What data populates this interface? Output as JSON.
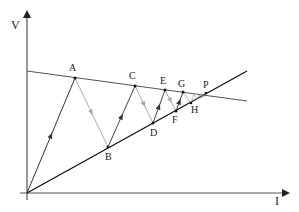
{
  "diagram": {
    "axes": {
      "y_label": "V",
      "x_label": "I",
      "origin": [
        27,
        193
      ],
      "y_axis_tip": [
        27,
        10
      ],
      "x_axis_tip": [
        290,
        193
      ]
    },
    "lines": {
      "load_line": {
        "from": [
          27,
          71
        ],
        "to": [
          247,
          101
        ],
        "color": "#555555"
      },
      "rising_line": {
        "from": [
          27,
          193
        ],
        "to": [
          247,
          71
        ],
        "color": "#111111"
      }
    },
    "points": [
      {
        "name": "A",
        "x": 75,
        "y": 78,
        "label_dx": -4,
        "label_dy": -6
      },
      {
        "name": "B",
        "x": 108,
        "y": 147,
        "label_dx": 0,
        "label_dy": 14
      },
      {
        "name": "C",
        "x": 135,
        "y": 86,
        "label_dx": -4,
        "label_dy": -6
      },
      {
        "name": "D",
        "x": 153,
        "y": 123,
        "label_dx": 0,
        "label_dy": 14
      },
      {
        "name": "E",
        "x": 165,
        "y": 90,
        "label_dx": -4,
        "label_dy": -6
      },
      {
        "name": "F",
        "x": 176,
        "y": 111,
        "label_dx": 0,
        "label_dy": 12
      },
      {
        "name": "G",
        "x": 183,
        "y": 92,
        "label_dx": -4,
        "label_dy": -5
      },
      {
        "name": "H",
        "x": 191,
        "y": 103,
        "label_dx": 2,
        "label_dy": 10
      },
      {
        "name": "P",
        "x": 206,
        "y": 93,
        "label_dx": -3,
        "label_dy": -5
      }
    ],
    "colors": {
      "axis": "#333333",
      "up_segment": "#444444",
      "down_segment": "#aaaaaa"
    }
  }
}
